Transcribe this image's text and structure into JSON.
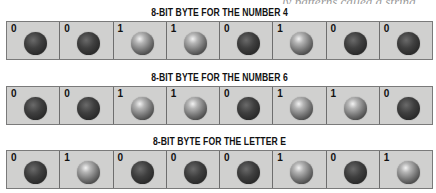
{
  "page": {
    "cutoff_text": "ly patterns called a string"
  },
  "bytes": [
    {
      "caption": "8-BIT BYTE FOR THE NUMBER 4",
      "bits": [
        "0",
        "0",
        "1",
        "1",
        "0",
        "1",
        "0",
        "0"
      ]
    },
    {
      "caption": "8-BIT BYTE FOR THE NUMBER 6",
      "bits": [
        "0",
        "0",
        "1",
        "1",
        "0",
        "1",
        "1",
        "0"
      ]
    },
    {
      "caption": "8-BIT BYTE FOR THE LETTER E",
      "bits": [
        "0",
        "1",
        "0",
        "0",
        "0",
        "1",
        "0",
        "1"
      ]
    }
  ],
  "colors": {
    "cell_background": "#d0d0cf",
    "cell_border": "#6e6e6e",
    "ball_off": "#2b2b2b",
    "ball_on_highlight": "#f2f2f2"
  }
}
